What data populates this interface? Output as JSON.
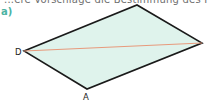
{
  "header": {
    "text": "...ere Vorschläge die Bestimmung des Fl..."
  },
  "exercise": {
    "part_label": "a)"
  },
  "figure": {
    "shape": "parallelogram",
    "fill_color": "#dff3ec",
    "edge_color": "#1a1a1a",
    "diagonal_color": "#e89a7c",
    "vertices": {
      "D": {
        "label": "D",
        "x": 24,
        "y": 51
      },
      "A": {
        "label": "A",
        "x": 87,
        "y": 89
      },
      "right": {
        "label": "",
        "x": 202,
        "y": 43
      },
      "top": {
        "label": "",
        "x": 137,
        "y": 5
      }
    },
    "diagonal": {
      "from": "D",
      "to": "right"
    }
  }
}
